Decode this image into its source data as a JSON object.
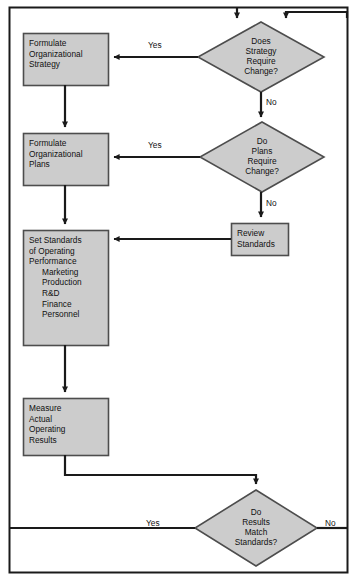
{
  "diagram": {
    "type": "flowchart",
    "colors": {
      "node_fill": "#cccccc",
      "node_stroke": "#4d4d4d",
      "line": "#1a1a1a",
      "background": "#ffffff",
      "frame": "#1a1a1a",
      "text": "#111111"
    },
    "processes": [
      {
        "id": "formulate-strategy",
        "shape": "rectangle",
        "lines": [
          "Formulate",
          "Organizational",
          "Strategy"
        ],
        "x": 23,
        "y": 33,
        "w": 85,
        "h": 52
      },
      {
        "id": "formulate-plans",
        "shape": "rectangle",
        "lines": [
          "Formulate",
          "Organizational",
          "Plans"
        ],
        "x": 23,
        "y": 133,
        "w": 85,
        "h": 52
      },
      {
        "id": "set-standards",
        "shape": "rectangle",
        "lines": [
          "Set Standards",
          "of Operating",
          "Performance"
        ],
        "indented_lines": [
          "Marketing",
          "Production",
          "R&D",
          "Finance",
          "Personnel"
        ],
        "x": 23,
        "y": 230,
        "w": 85,
        "h": 115
      },
      {
        "id": "measure-results",
        "shape": "rectangle",
        "lines": [
          "Measure",
          "Actual",
          "Operating",
          "Results"
        ],
        "x": 23,
        "y": 398,
        "w": 85,
        "h": 57
      },
      {
        "id": "review-standards",
        "shape": "rectangle",
        "lines": [
          "Review",
          "Standards"
        ],
        "x": 231,
        "y": 223,
        "w": 57,
        "h": 32
      }
    ],
    "decisions": [
      {
        "id": "strategy-change",
        "shape": "diamond",
        "lines": [
          "Does",
          "Strategy",
          "Require",
          "Change?"
        ],
        "cx": 261,
        "cy": 57,
        "rx": 63,
        "ry": 35
      },
      {
        "id": "plans-change",
        "shape": "diamond",
        "lines": [
          "Do",
          "Plans",
          "Require",
          "Change?"
        ],
        "cx": 262,
        "cy": 157,
        "rx": 62,
        "ry": 35
      },
      {
        "id": "results-match",
        "shape": "diamond",
        "lines": [
          "Do",
          "Results",
          "Match",
          "Standards?"
        ],
        "cx": 256,
        "cy": 528,
        "rx": 61,
        "ry": 38
      }
    ],
    "edge_labels": [
      {
        "id": "yes-strategy",
        "text": "Yes",
        "x": 148,
        "y": 40
      },
      {
        "id": "no-strategy",
        "text": "No",
        "x": 266,
        "y": 97
      },
      {
        "id": "yes-plans",
        "text": "Yes",
        "x": 148,
        "y": 140
      },
      {
        "id": "no-plans",
        "text": "No",
        "x": 266,
        "y": 198
      },
      {
        "id": "yes-results",
        "text": "Yes",
        "x": 146,
        "y": 518
      },
      {
        "id": "no-results",
        "text": "No",
        "x": 325,
        "y": 518
      }
    ]
  }
}
